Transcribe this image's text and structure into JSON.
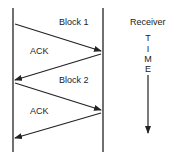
{
  "labels": {
    "block1": "Block 1",
    "ack1": "ACK",
    "block2": "Block 2",
    "ack2": "ACK",
    "receiver": "Receiver"
  },
  "time_axis": {
    "letters": [
      "T",
      "I",
      "M",
      "E"
    ]
  },
  "colors": {
    "stroke": "#222222"
  }
}
